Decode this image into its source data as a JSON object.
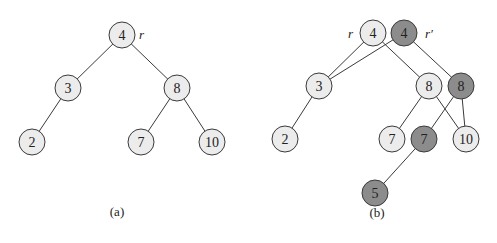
{
  "node_radius": 13,
  "colors": {
    "light": "#ececec",
    "dark": "#8c8c8c",
    "stroke": "#3a3a3a"
  },
  "panels": [
    {
      "id": "a",
      "caption": "(a)",
      "caption_pos": [
        117,
        211
      ],
      "labels": [
        {
          "text": "r",
          "x": 139,
          "y": 34
        }
      ],
      "nodes": [
        {
          "key": "4",
          "x": 122,
          "y": 35,
          "shade": "light"
        },
        {
          "key": "3",
          "x": 68,
          "y": 88,
          "shade": "light"
        },
        {
          "key": "8",
          "x": 177,
          "y": 88,
          "shade": "light"
        },
        {
          "key": "2",
          "x": 32,
          "y": 142,
          "shade": "light"
        },
        {
          "key": "7",
          "x": 141,
          "y": 142,
          "shade": "light"
        },
        {
          "key": "10",
          "x": 212,
          "y": 142,
          "shade": "light"
        }
      ],
      "edges": [
        [
          0,
          1
        ],
        [
          0,
          2
        ],
        [
          1,
          3
        ],
        [
          2,
          4
        ],
        [
          2,
          5
        ]
      ]
    },
    {
      "id": "b",
      "caption": "(b)",
      "caption_pos": [
        377,
        212
      ],
      "labels": [
        {
          "text": "r",
          "x": 348,
          "y": 33
        },
        {
          "text": "r′",
          "x": 425,
          "y": 33
        }
      ],
      "nodes": [
        {
          "key": "4",
          "x": 373,
          "y": 33,
          "shade": "light"
        },
        {
          "key": "4",
          "x": 404,
          "y": 33,
          "shade": "dark"
        },
        {
          "key": "3",
          "x": 319,
          "y": 86,
          "shade": "light"
        },
        {
          "key": "8",
          "x": 429,
          "y": 86,
          "shade": "light"
        },
        {
          "key": "8",
          "x": 461,
          "y": 86,
          "shade": "dark"
        },
        {
          "key": "2",
          "x": 285,
          "y": 139,
          "shade": "light"
        },
        {
          "key": "7",
          "x": 392,
          "y": 139,
          "shade": "light"
        },
        {
          "key": "7",
          "x": 424,
          "y": 139,
          "shade": "dark"
        },
        {
          "key": "10",
          "x": 466,
          "y": 139,
          "shade": "light"
        },
        {
          "key": "5",
          "x": 375,
          "y": 193,
          "shade": "dark"
        }
      ],
      "edges": [
        [
          0,
          2
        ],
        [
          0,
          3
        ],
        [
          1,
          2
        ],
        [
          1,
          4
        ],
        [
          2,
          5
        ],
        [
          3,
          6
        ],
        [
          3,
          8
        ],
        [
          4,
          7
        ],
        [
          4,
          8
        ],
        [
          7,
          9
        ]
      ]
    }
  ]
}
